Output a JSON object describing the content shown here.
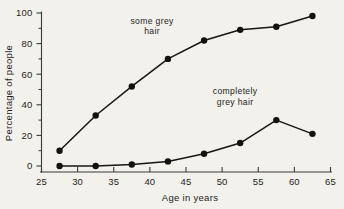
{
  "chart_data": {
    "type": "line",
    "title": "",
    "subtitle": "",
    "xlabel": "Age in years",
    "ylabel": "Percentage of people",
    "xlim": [
      25,
      65
    ],
    "ylim": [
      0,
      100
    ],
    "xticks": [
      25,
      30,
      35,
      40,
      45,
      50,
      55,
      60,
      65
    ],
    "xtick_labels": [
      "25",
      "30",
      "35",
      "40",
      "45",
      "50",
      "55",
      "60",
      "65"
    ],
    "yticks": [
      0,
      20,
      40,
      60,
      80,
      100
    ],
    "ytick_labels": [
      "0",
      "20",
      "40",
      "60",
      "80",
      "100"
    ],
    "yticks_minor": [
      10,
      30,
      50,
      70,
      90
    ],
    "grid": false,
    "legend_position": "inline-annotations",
    "markers": "filled-circle",
    "x": [
      27.5,
      32.5,
      37.5,
      42.5,
      47.5,
      52.5,
      57.5,
      62.5
    ],
    "series": [
      {
        "name": "some grey hair",
        "label_line1": "some grey",
        "label_line2": "hair",
        "color": "#161614",
        "values": [
          10,
          33,
          52,
          70,
          82,
          89,
          91,
          98
        ]
      },
      {
        "name": "completely grey hair",
        "label_line1": "completely",
        "label_line2": "grey hair",
        "color": "#161614",
        "values": [
          0,
          0,
          1,
          3,
          8,
          15,
          30,
          21
        ]
      }
    ],
    "annotations": [
      {
        "text_line1": "some grey",
        "text_line2": "hair",
        "x": 40.3,
        "y": 93
      },
      {
        "text_line1": "completely",
        "text_line2": "grey hair",
        "x": 51.8,
        "y": 47
      }
    ]
  },
  "figure": {
    "background_color": "#f3f1ec",
    "ink_color": "#1d1d1b"
  }
}
